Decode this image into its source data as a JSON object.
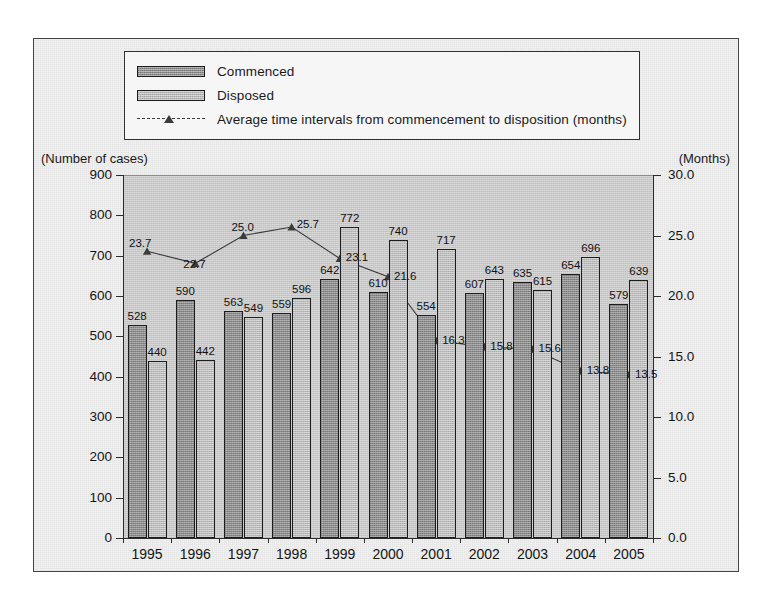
{
  "legend": {
    "items": [
      {
        "label": "Commenced",
        "type": "bar",
        "color": "#8e8e8e",
        "icon": "bar-swatch-dark"
      },
      {
        "label": "Disposed",
        "type": "bar",
        "color": "#bdbdbd",
        "icon": "bar-swatch-light"
      },
      {
        "label": "Average time intervals from commencement to disposition (months)",
        "type": "line",
        "color": "#3b3b3b",
        "icon": "line-triangle-marker"
      }
    ]
  },
  "axes": {
    "left_caption": "(Number of cases)",
    "right_caption": "(Months)",
    "left_ticks": [
      "900",
      "800",
      "700",
      "600",
      "500",
      "400",
      "300",
      "200",
      "100",
      "0"
    ],
    "right_ticks": [
      "30.0",
      "25.0",
      "20.0",
      "15.0",
      "10.0",
      "5.0",
      "0.0"
    ]
  },
  "chart_data": {
    "type": "bar",
    "title": "",
    "xlabel": "",
    "ylabel": "(Number of cases)",
    "y2label": "(Months)",
    "ylim": [
      0,
      900
    ],
    "y2lim": [
      0,
      30
    ],
    "grid": false,
    "legend_position": "top",
    "categories": [
      "1995",
      "1996",
      "1997",
      "1998",
      "1999",
      "2000",
      "2001",
      "2002",
      "2003",
      "2004",
      "2005"
    ],
    "series": [
      {
        "name": "Commenced",
        "kind": "bar",
        "axis": "left",
        "color": "#8e8e8e",
        "values": [
          528,
          590,
          563,
          559,
          642,
          610,
          554,
          607,
          635,
          654,
          579
        ],
        "labels": [
          "528",
          "590",
          "563",
          "559",
          "642",
          "610",
          "554",
          "607",
          "635",
          "654",
          "579"
        ]
      },
      {
        "name": "Disposed",
        "kind": "bar",
        "axis": "left",
        "color": "#bdbdbd",
        "values": [
          440,
          442,
          549,
          596,
          772,
          740,
          717,
          643,
          615,
          696,
          639
        ],
        "labels": [
          "440",
          "442",
          "549",
          "596",
          "772",
          "740",
          "717",
          "643",
          "615",
          "696",
          "639"
        ]
      },
      {
        "name": "Average time intervals from commencement to disposition (months)",
        "kind": "line",
        "axis": "right",
        "color": "#3b3b3b",
        "values": [
          23.7,
          22.7,
          25.0,
          25.7,
          23.1,
          21.6,
          16.3,
          15.8,
          15.6,
          13.8,
          13.5
        ],
        "labels": [
          "23.7",
          "22.7",
          "25.0",
          "25.7",
          "23.1",
          "21.6",
          "16.3",
          "15.8",
          "15.6",
          "13.8",
          "13.5"
        ]
      }
    ]
  }
}
